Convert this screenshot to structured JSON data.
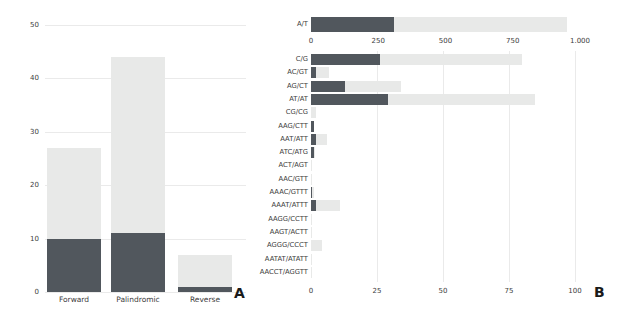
{
  "colors": {
    "dark_segment": "#51575d",
    "light_segment": "#e8e9e8",
    "gridline": "#eaeaea",
    "text": "#3d3d3d"
  },
  "panel_a_letter": "A",
  "panel_b_letter": "B",
  "chart_data": [
    {
      "id": "panel_a",
      "type": "bar",
      "stacked": true,
      "orientation": "vertical",
      "panel_label": "A",
      "categories": [
        "Forward",
        "Palindromic",
        "Reverse"
      ],
      "series": [
        {
          "name": "dark",
          "values": [
            10,
            11,
            1
          ]
        },
        {
          "name": "light",
          "values": [
            17,
            33,
            6
          ]
        }
      ],
      "totals": [
        27,
        44,
        7
      ],
      "ylim": [
        0,
        50
      ],
      "yticks": [
        0,
        10,
        20,
        30,
        40,
        50
      ],
      "ytick_labels": [
        "0",
        "10",
        "20",
        "30",
        "40",
        "50"
      ],
      "grid": "horizontal",
      "legend": "none"
    },
    {
      "id": "panel_b_top",
      "type": "bar",
      "stacked": true,
      "orientation": "horizontal",
      "categories": [
        "A/T"
      ],
      "series": [
        {
          "name": "dark",
          "values": [
            310
          ]
        },
        {
          "name": "light",
          "values": [
            640
          ]
        }
      ],
      "totals": [
        950
      ],
      "xlim": [
        0,
        1000
      ],
      "xticks": [
        0,
        250,
        500,
        750,
        1000
      ],
      "xtick_labels": [
        "0",
        "250",
        "500",
        "750",
        "1.000"
      ],
      "legend": "none"
    },
    {
      "id": "panel_b_bottom",
      "type": "bar",
      "stacked": true,
      "orientation": "horizontal",
      "panel_label": "B",
      "categories": [
        "C/G",
        "AC/GT",
        "AG/CT",
        "AT/AT",
        "CG/CG",
        "AAG/CTT",
        "AAT/ATT",
        "ATC/ATG",
        "ACT/AGT",
        "AAC/GTT",
        "AAAC/GTTT",
        "AAAT/ATTT",
        "AAGG/CCTT",
        "AAGT/ACTT",
        "AGGG/CCCT",
        "AATAT/ATATT",
        "AACCT/AGGTT"
      ],
      "series": [
        {
          "name": "dark",
          "values": [
            26,
            2,
            13,
            29,
            0,
            1,
            2,
            1,
            0,
            0,
            0.5,
            2,
            0,
            0,
            0,
            0,
            0
          ]
        },
        {
          "name": "light",
          "values": [
            54,
            5,
            21,
            56,
            2,
            0,
            4,
            0.5,
            0.5,
            0.5,
            0.5,
            9,
            0.5,
            0.5,
            4,
            0.5,
            0.5
          ]
        }
      ],
      "totals": [
        80,
        7,
        34,
        85,
        2,
        1,
        6,
        1.5,
        0.5,
        0.5,
        1,
        11,
        0.5,
        0.5,
        4,
        0.5,
        0.5
      ],
      "xlim": [
        0,
        100
      ],
      "xticks": [
        0,
        25,
        50,
        75,
        100
      ],
      "xtick_labels": [
        "0",
        "25",
        "50",
        "75",
        "100"
      ],
      "grid": "vertical",
      "legend": "none"
    }
  ]
}
